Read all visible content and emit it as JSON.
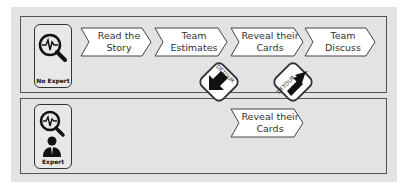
{
  "colors": {
    "background": "#e3e3e3",
    "border": "#555555",
    "step_fill": "#ffffff",
    "icon": "#111111"
  },
  "lanes": [
    {
      "persona": {
        "label": "No Expert",
        "icon": "magnifier-pulse-icon"
      },
      "steps": [
        {
          "line1": "Read the",
          "line2": "Story"
        },
        {
          "line1": "Team",
          "line2": "Estimates"
        },
        {
          "line1": "Reveal their",
          "line2": "Cards"
        },
        {
          "line1": "Team",
          "line2": "Discuss"
        }
      ]
    },
    {
      "persona": {
        "label": "Expert",
        "icon": "magnifier-pulse-person-icon"
      },
      "steps": [
        {
          "line1": "Reveal their",
          "line2": "Cards"
        }
      ]
    }
  ],
  "detours": [
    {
      "label": "DETOUR",
      "direction": "down-right"
    },
    {
      "label": "DETOUR",
      "direction": "up-right"
    }
  ]
}
